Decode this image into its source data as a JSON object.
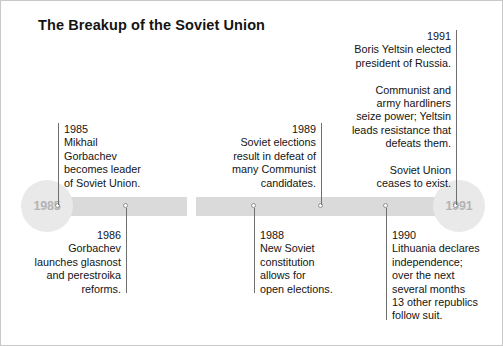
{
  "title": "The Breakup of the Soviet Union",
  "axis": {
    "start_label": "1985",
    "end_label": "1991",
    "bar_color": "#dadada",
    "endpoint_color": "#e9e9e9",
    "endpoint_text_color": "#b4b4b4",
    "rule_color": "#6e6e6e"
  },
  "events": {
    "e1985": {
      "year": "1985",
      "lines": "Mikhail\nGorbachev\nbecomes leader\nof Soviet Union."
    },
    "e1989": {
      "year": "1989",
      "lines": "Soviet elections\nresult in defeat of\nmany Communist\ncandidates."
    },
    "e1991": {
      "year": "1991",
      "para1": "Boris Yeltsin elected\npresident of Russia.",
      "para2": "Communist and\narmy hardliners\nseize power; Yeltsin\nleads resistance that\ndefeats them.",
      "para3": "Soviet Union\nceases to exist."
    },
    "e1986": {
      "year": "1986",
      "lines": "Gorbachev\nlaunches glasnost\nand perestroika\nreforms."
    },
    "e1988": {
      "year": "1988",
      "lines": "New Soviet\nconstitution\nallows for\nopen elections."
    },
    "e1990": {
      "year": "1990",
      "lines": "Lithuania declares\nindependence;\nover the next\nseveral months\n13 other republics\nfollow suit."
    }
  }
}
